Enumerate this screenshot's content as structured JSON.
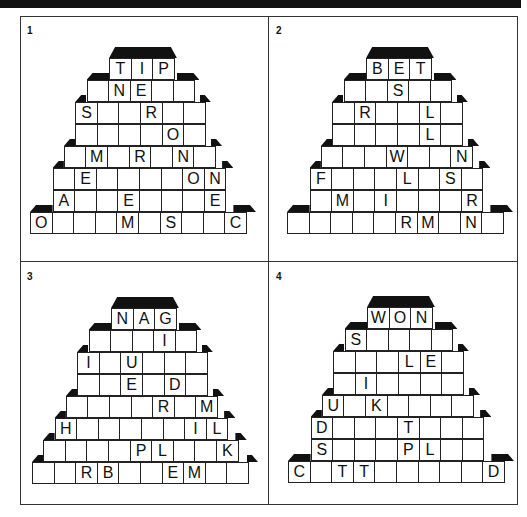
{
  "page": {
    "puzzles": [
      {
        "number": "1",
        "rows": [
          [
            "T",
            "I",
            "P"
          ],
          [
            "",
            "N",
            "E",
            "",
            ""
          ],
          [
            "S",
            "",
            "",
            "R",
            "",
            ""
          ],
          [
            "",
            "",
            "",
            "",
            "O",
            ""
          ],
          [
            "",
            "M",
            "",
            "R",
            "",
            "N",
            ""
          ],
          [
            "",
            "E",
            "",
            "",
            "",
            "",
            "O",
            "N"
          ],
          [
            "A",
            "",
            "",
            "E",
            "",
            "",
            "",
            "E"
          ],
          [
            "O",
            "",
            "",
            "",
            "M",
            "",
            "S",
            "",
            "",
            "C"
          ]
        ]
      },
      {
        "number": "2",
        "rows": [
          [
            "B",
            "E",
            "T"
          ],
          [
            "",
            "",
            "S",
            "",
            ""
          ],
          [
            "",
            "R",
            "",
            "",
            "L",
            ""
          ],
          [
            "",
            "",
            "",
            "",
            "L",
            ""
          ],
          [
            "",
            "",
            "",
            "W",
            "",
            "",
            "N"
          ],
          [
            "F",
            "",
            "",
            "",
            "L",
            "",
            "S",
            ""
          ],
          [
            "",
            "M",
            "",
            "I",
            "",
            "",
            "",
            "R"
          ],
          [
            "",
            "",
            "",
            "",
            "",
            "R",
            "M",
            "",
            "N",
            ""
          ]
        ]
      },
      {
        "number": "3",
        "rows": [
          [
            "N",
            "A",
            "G"
          ],
          [
            "",
            "",
            "",
            "I",
            ""
          ],
          [
            "I",
            "",
            "U",
            "",
            "",
            ""
          ],
          [
            "",
            "",
            "E",
            "",
            "D",
            ""
          ],
          [
            "",
            "",
            "",
            "",
            "R",
            "",
            "M"
          ],
          [
            "H",
            "",
            "",
            "",
            "",
            "",
            "I",
            "L"
          ],
          [
            "",
            "",
            "",
            "",
            "P",
            "L",
            "",
            "",
            "K"
          ],
          [
            "",
            "",
            "R",
            "B",
            "",
            "",
            "E",
            "M",
            "",
            ""
          ]
        ]
      },
      {
        "number": "4",
        "rows": [
          [
            "W",
            "O",
            "N"
          ],
          [
            "S",
            "",
            "",
            "",
            ""
          ],
          [
            "",
            "",
            "",
            "L",
            "E",
            ""
          ],
          [
            "",
            "I",
            "",
            "",
            "",
            ""
          ],
          [
            "U",
            "",
            "K",
            "",
            "",
            "",
            ""
          ],
          [
            "D",
            "",
            "",
            "",
            "T",
            "",
            "",
            ""
          ],
          [
            "S",
            "",
            "",
            "",
            "P",
            "L",
            "",
            ""
          ],
          [
            "C",
            "",
            "T",
            "T",
            "",
            "",
            "",
            "",
            "",
            "D"
          ]
        ]
      }
    ]
  }
}
